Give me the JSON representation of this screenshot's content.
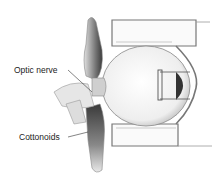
{
  "figure": {
    "type": "anatomical-illustration",
    "labels": [
      {
        "id": "optic-nerve",
        "text": "Optic nerve"
      },
      {
        "id": "cottonoids",
        "text": "Cottonoids"
      }
    ]
  },
  "colors": {
    "background": "#ffffff",
    "outline": "#555555",
    "dark_tissue": "#4a4a4a",
    "light_gray": "#d8d8d8"
  }
}
